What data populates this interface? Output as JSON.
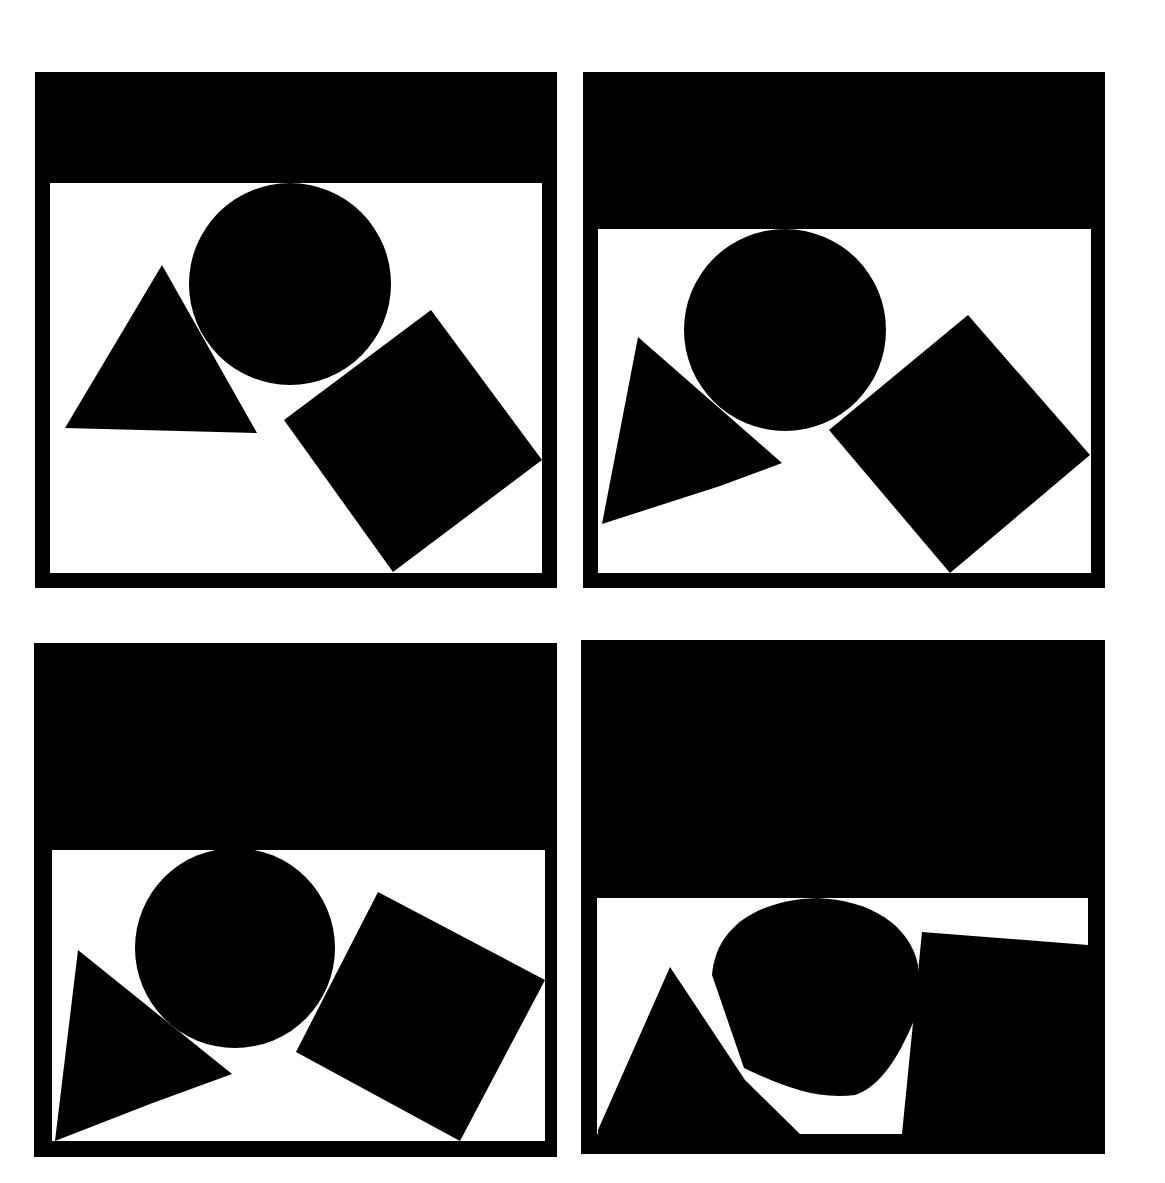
{
  "canvas": {
    "width": 1165,
    "height": 1183,
    "background": "#ffffff",
    "ink": "#000000"
  },
  "panels": [
    {
      "id": "panel-1",
      "outer": {
        "x": 35,
        "y": 72,
        "w": 522,
        "h": 516
      },
      "window": {
        "x": 50,
        "y": 183,
        "w": 492,
        "h": 390
      },
      "circle": {
        "cx": 290,
        "cy": 284,
        "r": 101
      },
      "triangle": "65,428 162,265 257,433",
      "square": "284,420 431,310 542,460 393,572"
    },
    {
      "id": "panel-2",
      "outer": {
        "x": 583,
        "y": 72,
        "w": 522,
        "h": 516
      },
      "window": {
        "x": 598,
        "y": 229,
        "w": 493,
        "h": 344
      },
      "circle": {
        "cx": 785,
        "cy": 330,
        "r": 101
      },
      "triangle": "602,524 638,337 782,463 720,486",
      "square": "829,430 968,315 1090,455 950,573"
    },
    {
      "id": "panel-3",
      "outer": {
        "x": 34,
        "y": 643,
        "w": 523,
        "h": 514
      },
      "window": {
        "x": 52,
        "y": 850,
        "w": 493,
        "h": 291
      },
      "circle": {
        "cx": 235,
        "cy": 948,
        "r": 100
      },
      "triangle": "55,1141 78,950 232,1074 150,1104",
      "square": "296,1052 378,892 545,980 460,1141"
    },
    {
      "id": "panel-4",
      "outer": {
        "x": 581,
        "y": 640,
        "w": 524,
        "h": 514
      },
      "window": {
        "x": 597,
        "y": 898,
        "w": 491,
        "h": 236
      },
      "blob": "M 712 975 C 716 925 760 900 817 898 C 870 900 910 925 918 965 L 920 1005 C 905 1045 885 1085 855 1095 C 815 1100 780 1085 744 1068 Z",
      "triangle": "598,1130 670,967 745,1080 800,1134 598,1134",
      "square": "922,932 1088,945 1088,1134 902,1134"
    }
  ]
}
